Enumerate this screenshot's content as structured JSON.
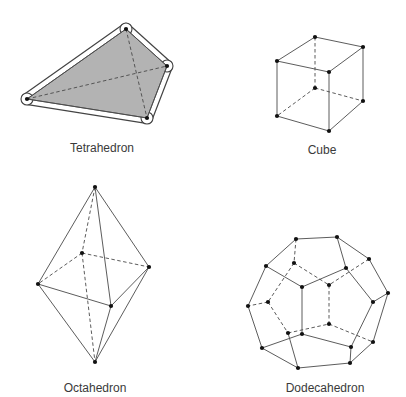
{
  "colors": {
    "background": "#ffffff",
    "edge": "#4a4a4a",
    "vertex": "#111111",
    "tetra_fill": "#b3b3b3",
    "label": "#3a3a3a"
  },
  "figures": [
    {
      "id": "tetrahedron",
      "label": "Tetrahedron",
      "label_pos": [
        102,
        141
      ],
      "filled": true,
      "vertices": [
        [
          126,
          29
        ],
        [
          167,
          66
        ],
        [
          27,
          99
        ],
        [
          147,
          118
        ]
      ],
      "outline": [
        [
          0,
          1
        ],
        [
          1,
          3
        ],
        [
          3,
          2
        ],
        [
          2,
          0
        ]
      ],
      "solid_edges": [
        [
          0,
          1
        ],
        [
          1,
          3
        ],
        [
          3,
          2
        ],
        [
          2,
          0
        ]
      ],
      "dashed_edges": [
        [
          0,
          3
        ],
        [
          2,
          1
        ]
      ]
    },
    {
      "id": "cube",
      "label": "Cube",
      "label_pos": [
        322,
        143
      ],
      "vertices": [
        [
          315,
          37
        ],
        [
          363,
          47
        ],
        [
          277,
          61
        ],
        [
          329,
          72
        ],
        [
          315,
          88
        ],
        [
          363,
          101
        ],
        [
          277,
          116
        ],
        [
          329,
          131
        ]
      ],
      "solid_edges": [
        [
          0,
          1
        ],
        [
          0,
          2
        ],
        [
          1,
          3
        ],
        [
          2,
          3
        ],
        [
          2,
          6
        ],
        [
          3,
          7
        ],
        [
          1,
          5
        ],
        [
          6,
          7
        ],
        [
          7,
          5
        ]
      ],
      "dashed_edges": [
        [
          0,
          4
        ],
        [
          4,
          6
        ],
        [
          4,
          5
        ]
      ]
    },
    {
      "id": "octahedron",
      "label": "Octahedron",
      "label_pos": [
        95,
        381
      ],
      "vertices": [
        [
          95,
          187
        ],
        [
          82,
          253
        ],
        [
          149,
          267
        ],
        [
          38,
          284
        ],
        [
          111,
          306
        ],
        [
          95,
          362
        ]
      ],
      "solid_edges": [
        [
          0,
          3
        ],
        [
          0,
          2
        ],
        [
          0,
          4
        ],
        [
          3,
          4
        ],
        [
          4,
          2
        ],
        [
          3,
          5
        ],
        [
          4,
          5
        ],
        [
          2,
          5
        ]
      ],
      "dashed_edges": [
        [
          0,
          1
        ],
        [
          1,
          3
        ],
        [
          1,
          2
        ],
        [
          1,
          5
        ]
      ]
    },
    {
      "id": "dodecahedron",
      "label": "Dodecahedron",
      "label_pos": [
        325,
        381
      ],
      "vertices": [
        [
          296,
          239
        ],
        [
          337,
          237
        ],
        [
          369,
          259
        ],
        [
          346,
          268
        ],
        [
          266,
          266
        ],
        [
          294,
          263
        ],
        [
          302,
          287
        ],
        [
          329,
          285
        ],
        [
          388,
          293
        ],
        [
          373,
          302
        ],
        [
          248,
          306
        ],
        [
          268,
          302
        ],
        [
          329,
          324
        ],
        [
          288,
          333
        ],
        [
          302,
          334
        ],
        [
          373,
          342
        ],
        [
          351,
          347
        ],
        [
          262,
          348
        ],
        [
          298,
          368
        ],
        [
          350,
          363
        ]
      ],
      "solid_edges": [
        [
          0,
          1
        ],
        [
          0,
          4
        ],
        [
          1,
          2
        ],
        [
          1,
          3
        ],
        [
          2,
          8
        ],
        [
          3,
          6
        ],
        [
          3,
          9
        ],
        [
          4,
          10
        ],
        [
          4,
          6
        ],
        [
          6,
          14
        ],
        [
          8,
          9
        ],
        [
          8,
          15
        ],
        [
          10,
          17
        ],
        [
          14,
          17
        ],
        [
          14,
          16
        ],
        [
          16,
          9
        ],
        [
          16,
          19
        ],
        [
          15,
          19
        ],
        [
          17,
          18
        ],
        [
          18,
          19
        ],
        [
          13,
          18
        ]
      ],
      "dashed_edges": [
        [
          0,
          5
        ],
        [
          5,
          11
        ],
        [
          5,
          7
        ],
        [
          2,
          7
        ],
        [
          11,
          10
        ],
        [
          7,
          12
        ],
        [
          11,
          13
        ],
        [
          13,
          12
        ],
        [
          12,
          15
        ]
      ]
    }
  ]
}
